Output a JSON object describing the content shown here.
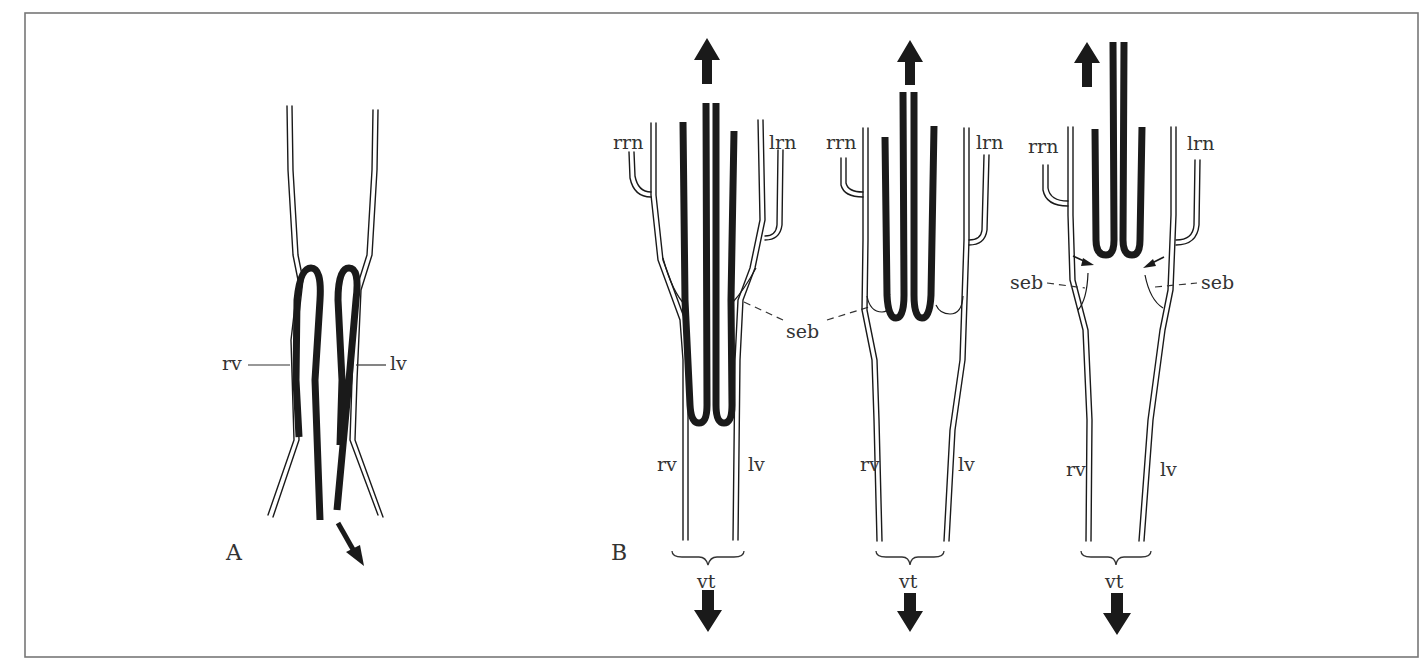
{
  "figure": {
    "panels": [
      {
        "id": "A",
        "label": "A",
        "labels": {
          "right_vessel": "rv",
          "left_vessel": "lv"
        }
      },
      {
        "id": "B",
        "label": "B",
        "stages": [
          {
            "labels": {
              "rrn": "rrn",
              "lrn": "lrn",
              "seb": "seb",
              "rv": "rv",
              "lv": "lv",
              "vt": "vt"
            }
          },
          {
            "labels": {
              "rrn": "rrn",
              "lrn": "lrn",
              "rv": "rv",
              "lv": "lv",
              "vt": "vt"
            }
          },
          {
            "labels": {
              "rrn": "rrn",
              "lrn": "lrn",
              "seb_left": "seb",
              "seb_right": "seb",
              "rv": "rv",
              "lv": "lv",
              "vt": "vt"
            }
          }
        ]
      }
    ],
    "colors": {
      "ink": "#1a1a1a",
      "frame": "#777777",
      "background": "#ffffff"
    }
  }
}
